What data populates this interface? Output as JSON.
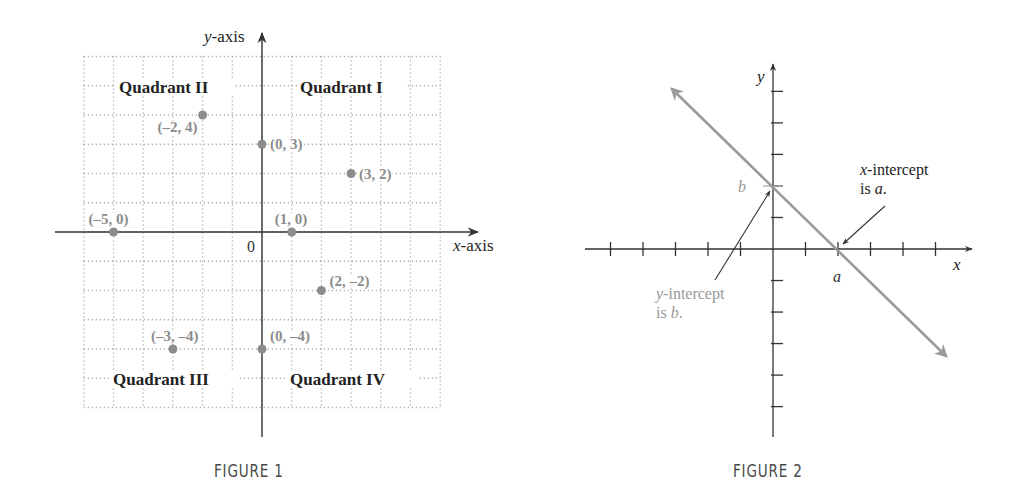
{
  "figures": [
    {
      "caption": "FIGURE 1",
      "axis_labels": {
        "x": "x-axis",
        "y": "y-axis",
        "x_var": "x",
        "x_rest": "-axis",
        "y_var": "y",
        "y_rest": "-axis"
      },
      "origin_label": "0",
      "quadrants": [
        "Quadrant I",
        "Quadrant II",
        "Quadrant III",
        "Quadrant IV"
      ],
      "points": [
        {
          "x": -2,
          "y": 4,
          "label": "(–2, 4)"
        },
        {
          "x": 0,
          "y": 3,
          "label": "(0, 3)"
        },
        {
          "x": 3,
          "y": 2,
          "label": "(3, 2)"
        },
        {
          "x": -5,
          "y": 0,
          "label": "(–5, 0)"
        },
        {
          "x": 1,
          "y": 0,
          "label": "(1, 0)"
        },
        {
          "x": 2,
          "y": -2,
          "label": "(2, –2)"
        },
        {
          "x": -3,
          "y": -4,
          "label": "(–3, –4)"
        },
        {
          "x": 0,
          "y": -4,
          "label": "(0, –4)"
        }
      ]
    },
    {
      "caption": "FIGURE 2",
      "axis_labels": {
        "x": "x",
        "y": "y"
      },
      "intercept_labels": {
        "a": "a",
        "b": "b"
      },
      "annotations": {
        "x_intercept": {
          "var": "x",
          "line1_rest": "-intercept",
          "line2_prefix": "is ",
          "line2_var": "a",
          "line2_suffix": "."
        },
        "y_intercept": {
          "var": "y",
          "line1_rest": "-intercept",
          "line2_prefix": "is ",
          "line2_var": "b",
          "line2_suffix": "."
        }
      }
    }
  ],
  "colors": {
    "axis": "#333333",
    "grid": "#9a9a9a",
    "point": "#8c8c8c",
    "point_label": "#8c8c8c",
    "line": "#9a9a9a",
    "text": "#222222",
    "muted_text": "#999999"
  },
  "chart_data": [
    {
      "type": "scatter",
      "title": "FIGURE 1",
      "xlabel": "x-axis",
      "ylabel": "y-axis",
      "xlim": [
        -6,
        6
      ],
      "ylim": [
        -6,
        6
      ],
      "grid": true,
      "series": [
        {
          "name": "points",
          "x": [
            -2,
            0,
            3,
            -5,
            1,
            2,
            -3,
            0
          ],
          "y": [
            4,
            3,
            2,
            0,
            0,
            -2,
            -4,
            -4
          ],
          "labels": [
            "(–2, 4)",
            "(0, 3)",
            "(3, 2)",
            "(–5, 0)",
            "(1, 0)",
            "(2, –2)",
            "(–3, –4)",
            "(0, –4)"
          ]
        }
      ],
      "annotations": [
        "Quadrant I",
        "Quadrant II",
        "Quadrant III",
        "Quadrant IV",
        "0"
      ]
    },
    {
      "type": "line",
      "title": "FIGURE 2",
      "xlabel": "x",
      "ylabel": "y",
      "grid": false,
      "xlim": [
        -6,
        6
      ],
      "ylim": [
        -6,
        6
      ],
      "series": [
        {
          "name": "line",
          "x": [
            -3,
            5
          ],
          "y": [
            5,
            -3
          ]
        }
      ],
      "annotations": [
        "b",
        "a",
        "x-intercept is a.",
        "y-intercept is b."
      ]
    }
  ]
}
